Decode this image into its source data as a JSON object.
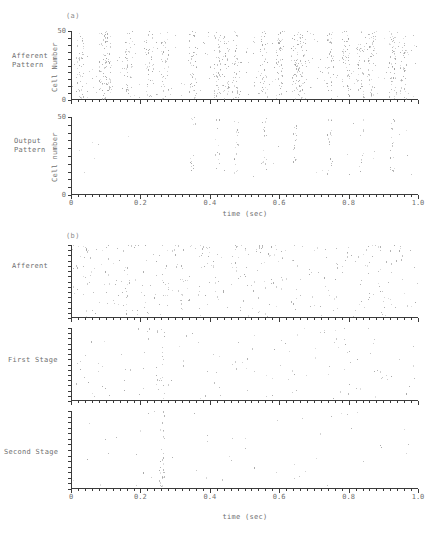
{
  "figure": {
    "panels": [
      {
        "tag": "(a)",
        "tag_x": 66,
        "tag_y": 12,
        "x_axis": {
          "title": "time (sec)",
          "title_x": 245,
          "title_y": 210,
          "min": 0,
          "max": 1.0,
          "major_ticks": [
            0,
            0.2,
            0.4,
            0.6,
            0.8,
            1.0
          ],
          "tick_labels": [
            "0",
            "0.2",
            "0.4",
            "0.6",
            "0.8",
            "1.0"
          ],
          "minor_tick_step": 0.02
        },
        "subplots": [
          {
            "row_label": "Afferent\nPattern",
            "row_label_x": 12,
            "row_label_y": 52,
            "y_axis_title": "Cell Number",
            "y_min": 0,
            "y_max": 50,
            "y_tick_labels": [
              "0",
              "50"
            ],
            "y_minor_count": 10,
            "left": 71,
            "top": 31,
            "width": 347,
            "height": 69
          },
          {
            "row_label": "Output\nPattern",
            "row_label_x": 14,
            "row_label_y": 137,
            "y_axis_title": "Cell number",
            "y_min": 0,
            "y_max": 50,
            "y_tick_labels": [
              "0",
              "50"
            ],
            "y_minor_count": 10,
            "left": 71,
            "top": 117,
            "width": 347,
            "height": 78
          }
        ]
      },
      {
        "tag": "(b)",
        "tag_x": 66,
        "tag_y": 232,
        "x_axis": {
          "title": "time (sec)",
          "title_x": 245,
          "title_y": 513,
          "min": 0,
          "max": 1.0,
          "major_ticks": [
            0,
            0.2,
            0.4,
            0.6,
            0.8,
            1.0
          ],
          "tick_labels": [
            "0",
            "0.2",
            "0.4",
            "0.6",
            "0.8",
            "1.0"
          ],
          "minor_tick_step": 0.02
        },
        "subplots": [
          {
            "row_label": "Afferent",
            "row_label_x": 12,
            "row_label_y": 262,
            "y_axis_title": "",
            "y_tick_labels": [],
            "y_minor_count": 14,
            "left": 71,
            "top": 245,
            "width": 347,
            "height": 73
          },
          {
            "row_label": "First Stage",
            "row_label_x": 8,
            "row_label_y": 356,
            "y_axis_title": "",
            "y_tick_labels": [],
            "y_minor_count": 14,
            "left": 71,
            "top": 328,
            "width": 347,
            "height": 73
          },
          {
            "row_label": "Second Stage",
            "row_label_x": 4,
            "row_label_y": 448,
            "y_axis_title": "",
            "y_tick_labels": [],
            "y_minor_count": 14,
            "left": 71,
            "top": 411,
            "width": 347,
            "height": 78
          }
        ]
      }
    ]
  },
  "chart_data": {
    "type": "scatter",
    "title": "",
    "xlabel": "time (sec)",
    "xlim": [
      0,
      1.0
    ],
    "grid": false,
    "legend": null,
    "panels": [
      {
        "panel": "(a)",
        "ylabel": "Cell Number",
        "ylim": [
          0,
          50
        ],
        "yticks": [
          0,
          50
        ],
        "series": [
          {
            "name": "Afferent Pattern",
            "ylabel": "Cell Number",
            "burst_times": [
              0.025,
              0.09,
              0.105,
              0.165,
              0.225,
              0.27,
              0.35,
              0.42,
              0.445,
              0.475,
              0.555,
              0.6,
              0.645,
              0.665,
              0.745,
              0.79,
              0.835,
              0.865,
              0.925,
              0.955
            ],
            "n_cells": 50,
            "approx_point_count": 980
          },
          {
            "name": "Output Pattern",
            "ylabel": "Cell number",
            "burst_times": [
              0.35,
              0.42,
              0.475,
              0.555,
              0.645,
              0.745,
              0.835,
              0.925
            ],
            "n_cells": 50,
            "approx_point_count": 120
          }
        ]
      },
      {
        "panel": "(b)",
        "ylabel": "",
        "yticks": [],
        "series": [
          {
            "name": "Afferent",
            "approx_point_count": 300,
            "note": "dense scatter, highest density in upper third"
          },
          {
            "name": "First Stage",
            "approx_point_count": 130,
            "note": "sparse scatter, loose vertical cluster near 0.26"
          },
          {
            "name": "Second Stage",
            "approx_point_count": 60,
            "note": "sparsest; pronounced vertical burst near t = 0.26"
          }
        ]
      }
    ]
  }
}
